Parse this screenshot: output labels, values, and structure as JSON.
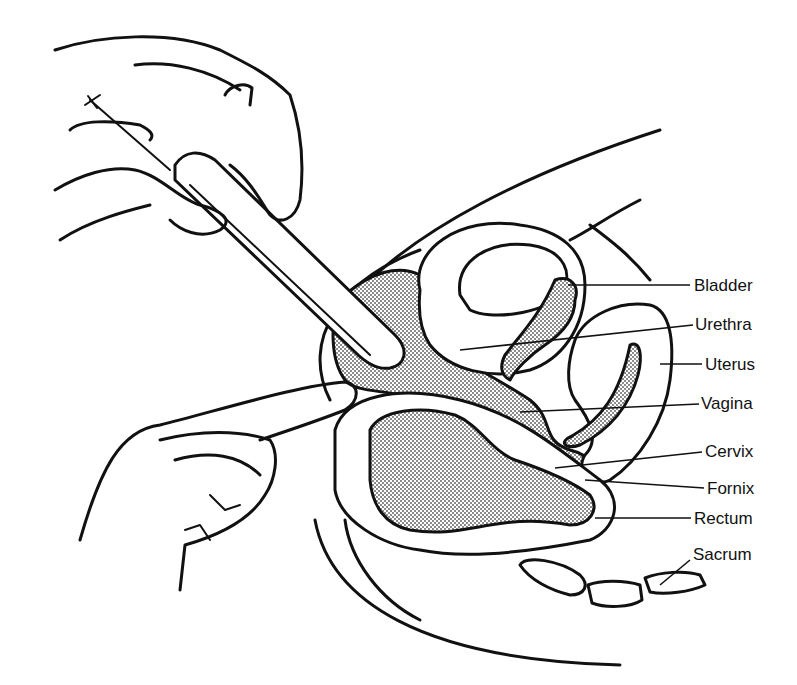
{
  "diagram": {
    "colors": {
      "ink": "#111111",
      "background": "#ffffff",
      "stipple": "#555555"
    },
    "labels": [
      {
        "id": "bladder",
        "text": "Bladder",
        "x": 694,
        "y": 277
      },
      {
        "id": "urethra",
        "text": "Urethra",
        "x": 695,
        "y": 316
      },
      {
        "id": "uterus",
        "text": "Uterus",
        "x": 705,
        "y": 356
      },
      {
        "id": "vagina",
        "text": "Vagina",
        "x": 701,
        "y": 395
      },
      {
        "id": "cervix",
        "text": "Cervix",
        "x": 705,
        "y": 443
      },
      {
        "id": "fornix",
        "text": "Fornix",
        "x": 707,
        "y": 480
      },
      {
        "id": "rectum",
        "text": "Rectum",
        "x": 694,
        "y": 510
      },
      {
        "id": "sacrum",
        "text": "Sacrum",
        "x": 693,
        "y": 546
      }
    ]
  }
}
